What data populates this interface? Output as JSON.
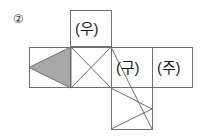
{
  "figure": {
    "item_number": "②",
    "background_color": "#fdfdfd",
    "stroke_color": "#6e6e6e",
    "fill_color": "#a8a8a8",
    "labels": {
      "top": "(우)",
      "right_inner": "(구)",
      "right_outer": "(주)"
    },
    "faces": [
      {
        "name": "top-face",
        "label": "(우)",
        "x": 70,
        "y": 10,
        "w": 42,
        "h": 37,
        "marking": "none"
      },
      {
        "name": "left-face",
        "label": "",
        "x": 29,
        "y": 47,
        "w": 42,
        "h": 41,
        "marking": "filled-kite"
      },
      {
        "name": "center-face",
        "label": "",
        "x": 70,
        "y": 47,
        "w": 42,
        "h": 41,
        "marking": "x-diagonals"
      },
      {
        "name": "inner-right-face",
        "label": "(구)",
        "x": 111,
        "y": 47,
        "w": 42,
        "h": 41,
        "marking": "none"
      },
      {
        "name": "outer-right-face",
        "label": "(주)",
        "x": 152,
        "y": 47,
        "w": 41,
        "h": 41,
        "marking": "none"
      },
      {
        "name": "bottom-face",
        "label": "",
        "x": 111,
        "y": 88,
        "w": 42,
        "h": 42,
        "marking": "right-chevron"
      }
    ]
  }
}
